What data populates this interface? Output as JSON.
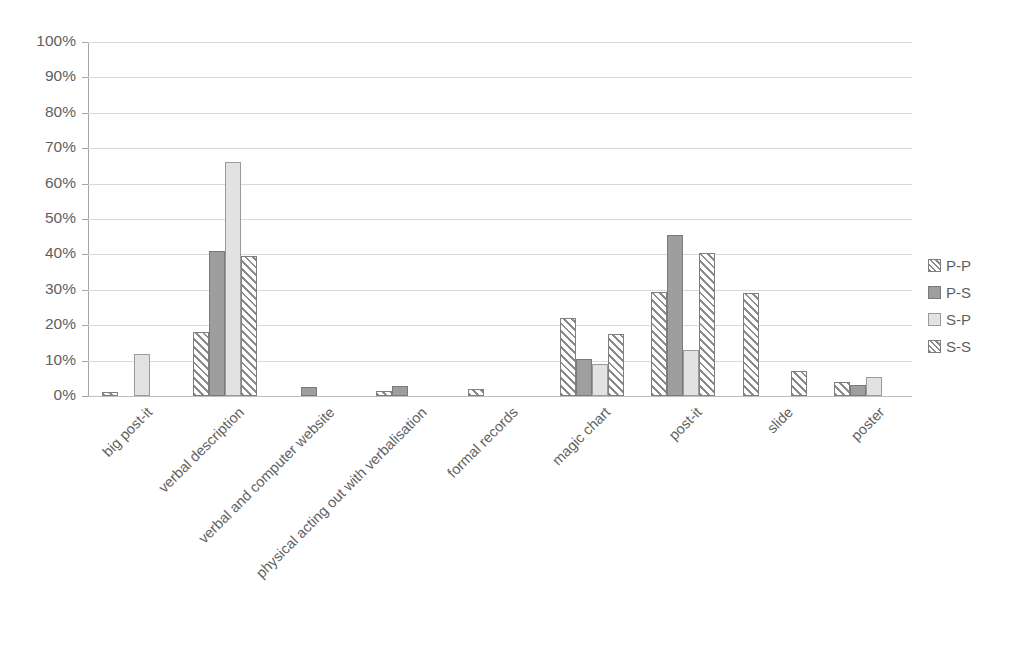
{
  "chart_data": {
    "type": "bar",
    "title": "",
    "subtitle": "",
    "xlabel": "",
    "ylabel": "",
    "ylim": [
      0,
      100
    ],
    "y_unit": "%",
    "grid": true,
    "legend_position": "right",
    "orientation": "vertical",
    "y_ticks": [
      "0%",
      "10%",
      "20%",
      "30%",
      "40%",
      "50%",
      "60%",
      "70%",
      "80%",
      "90%",
      "100%"
    ],
    "y_tick_values": [
      0,
      10,
      20,
      30,
      40,
      50,
      60,
      70,
      80,
      90,
      100
    ],
    "categories": [
      "big post-it",
      "verbal description",
      "verbal and computer website",
      "physical acting out with verbalisation",
      "formal records",
      "magic chart",
      "post-it",
      "slide",
      "poster"
    ],
    "series": [
      {
        "name": "P-P",
        "color": "#ffffff",
        "pattern": "diagonal-hatch",
        "values": [
          1,
          18,
          0,
          1.5,
          2,
          22,
          29.5,
          29,
          4
        ]
      },
      {
        "name": "P-S",
        "color": "#9e9e9e",
        "pattern": "solid",
        "values": [
          0,
          41,
          2.5,
          2.8,
          0,
          10.5,
          45.5,
          0,
          3
        ]
      },
      {
        "name": "S-P",
        "color": "#e2e2e2",
        "pattern": "solid",
        "values": [
          12,
          66,
          0,
          0,
          0,
          9,
          13,
          0,
          5.5
        ]
      },
      {
        "name": "S-S",
        "color": "#ffffff",
        "pattern": "diagonal-hatch",
        "values": [
          0,
          39.5,
          0,
          0,
          0,
          17.5,
          40.5,
          7,
          0
        ]
      }
    ]
  },
  "legend": {
    "items": [
      {
        "label": "P-P",
        "swatch": "hatch-swatch"
      },
      {
        "label": "P-S",
        "swatch": "dark-gray-swatch"
      },
      {
        "label": "S-P",
        "swatch": "light-gray-swatch"
      },
      {
        "label": "S-S",
        "swatch": "hatch-swatch"
      }
    ]
  }
}
